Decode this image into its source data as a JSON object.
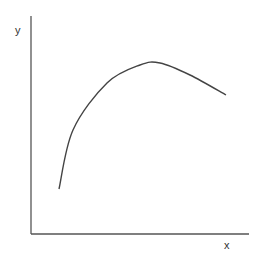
{
  "chart_data": {
    "type": "line",
    "title": "",
    "xlabel": "x",
    "ylabel": "y",
    "grid": false,
    "legend": null,
    "ticks": false,
    "series": [
      {
        "name": "curve",
        "description": "concave-down curve rising steeply, peaking, then declining",
        "points_px": [
          [
            59,
            189
          ],
          [
            73,
            130
          ],
          [
            107,
            83
          ],
          [
            140,
            65
          ],
          [
            160,
            63
          ],
          [
            190,
            75
          ],
          [
            226,
            95
          ]
        ]
      }
    ]
  },
  "axes": {
    "x_label": "x",
    "y_label": "y",
    "color": "#555555"
  }
}
